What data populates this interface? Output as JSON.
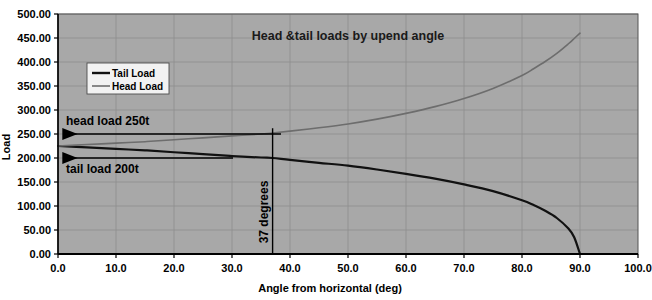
{
  "chart_data": {
    "type": "line",
    "title": "Head &tail loads by upend angle",
    "xlabel": "Angle from horizontal (deg)",
    "ylabel": "Load",
    "xlim": [
      0,
      100
    ],
    "ylim": [
      0,
      500
    ],
    "grid": true,
    "legend_position": "upper-left-inside",
    "plot_background": "#a8a8a8",
    "x_ticks": [
      "0.0",
      "10.0",
      "20.0",
      "30.0",
      "40.0",
      "50.0",
      "60.0",
      "70.0",
      "80.0",
      "90.0",
      "100.0"
    ],
    "x_tick_values": [
      0,
      10,
      20,
      30,
      40,
      50,
      60,
      70,
      80,
      90,
      100
    ],
    "y_ticks": [
      "0.00",
      "50.00",
      "100.00",
      "150.00",
      "200.00",
      "250.00",
      "300.00",
      "350.00",
      "400.00",
      "450.00",
      "500.00"
    ],
    "y_tick_values": [
      0,
      50,
      100,
      150,
      200,
      250,
      300,
      350,
      400,
      450,
      500
    ],
    "x": [
      0,
      5,
      10,
      15,
      20,
      25,
      30,
      35,
      37,
      40,
      45,
      50,
      55,
      60,
      65,
      70,
      75,
      80,
      82,
      84,
      86,
      88,
      89,
      90
    ],
    "series": [
      {
        "name": "Tail Load",
        "color": "#111111",
        "width": 2.2,
        "values": [
          225,
          222,
          219,
          216,
          212,
          208,
          204,
          201,
          200,
          196,
          190,
          184,
          176,
          167,
          157,
          145,
          131,
          112,
          102,
          90,
          75,
          53,
          35,
          0
        ]
      },
      {
        "name": "Head Load",
        "color": "#6d6d6d",
        "width": 1.6,
        "values": [
          225,
          228,
          231,
          234,
          238,
          242,
          246,
          250,
          252,
          256,
          263,
          271,
          281,
          293,
          307,
          324,
          345,
          372,
          386,
          401,
          418,
          438,
          449,
          460
        ]
      }
    ],
    "annotations": [
      {
        "id": "head-load-annotation",
        "label": "head load 250t",
        "value": 250,
        "arrow": "left",
        "y_value": 250
      },
      {
        "id": "tail-load-annotation",
        "label": "tail load 200t",
        "value": 200,
        "arrow": "left",
        "y_value": 200
      },
      {
        "id": "vertical-marker",
        "label": "37 degrees",
        "x_value": 37,
        "orientation": "vertical"
      }
    ]
  },
  "legend": {
    "items": [
      {
        "label": "Tail Load",
        "color": "#111111"
      },
      {
        "label": "Head Load",
        "color": "#6d6d6d"
      }
    ]
  },
  "colors": {
    "plot_bg": "#a8a8a8",
    "page_bg": "#ffffff",
    "grid": "#8e8e8e",
    "axis": "#000000",
    "tail_load": "#111111",
    "head_load": "#6d6d6d",
    "legend_bg": "#f2f2f2"
  }
}
